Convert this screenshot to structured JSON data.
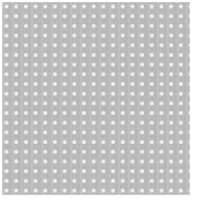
{
  "panel": {
    "name": "perforated-grid-swatch",
    "background_color": "#b9b9b9",
    "dot_color": "#f2f2f2",
    "dot_spacing_px": 9.7,
    "dot_size_px": 3,
    "columns": 19,
    "rows": 20,
    "left_px": 2,
    "top_px": 2,
    "width_px": 188,
    "height_px": 193
  },
  "caption": {
    "text": "■■■■■ ■■■",
    "color": "#6b6b6b",
    "note_visible": "illegible small characters clipped at image bottom"
  },
  "canvas": {
    "width_px": 204,
    "height_px": 213,
    "background_color": "#ffffff"
  }
}
